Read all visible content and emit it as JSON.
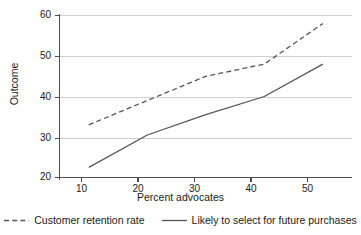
{
  "chart_data": {
    "type": "line",
    "title": "",
    "xlabel": "Percent advocates",
    "ylabel": "Outcome",
    "xlim": [
      5,
      55
    ],
    "ylim": [
      20,
      60
    ],
    "xticks": [
      10,
      20,
      30,
      40,
      50
    ],
    "yticks": [
      20,
      30,
      40,
      50,
      60
    ],
    "xtick_labels": [
      "10",
      "20",
      "30",
      "40",
      "50"
    ],
    "ytick_labels": [
      "20",
      "30",
      "40",
      "50",
      "60"
    ],
    "grid": "horizontal",
    "legend_position": "bottom",
    "x": [
      10,
      20,
      30,
      40,
      50
    ],
    "series": [
      {
        "name": "Customer retention rate",
        "style": "dashed",
        "color": "#555555",
        "values": [
          33,
          39,
          45,
          48,
          58
        ]
      },
      {
        "name": "Likely to select for future purchases",
        "style": "solid",
        "color": "#555555",
        "values": [
          22.5,
          30.5,
          35.5,
          40,
          48
        ]
      }
    ]
  },
  "axes": {
    "y_title": "Outcome",
    "x_title": "Percent advocates",
    "y_tick_labels": [
      "60",
      "50",
      "40",
      "30",
      "20"
    ],
    "x_tick_labels": [
      "10",
      "20",
      "30",
      "40",
      "50"
    ]
  },
  "legend": {
    "items": [
      {
        "label": "Customer retention rate",
        "style": "dashed"
      },
      {
        "label": "Likely to select for future purchases",
        "style": "solid"
      }
    ]
  },
  "colors": {
    "line": "#555555",
    "grid": "#cfcfcf",
    "axis": "#4d4d4d",
    "text": "#1a1a1a",
    "background": "#ffffff"
  }
}
